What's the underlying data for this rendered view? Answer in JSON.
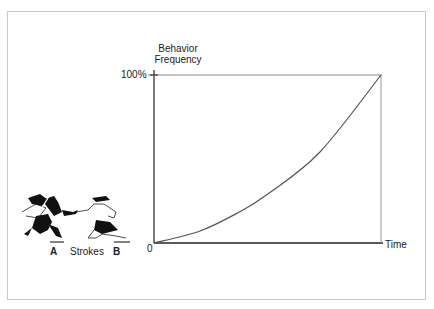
{
  "chart_data": {
    "type": "line",
    "title": "",
    "xlabel": "Time",
    "ylabel": "Behavior Frequency",
    "ylabel_lines": [
      "Behavior",
      "Frequency"
    ],
    "y_ticks": [
      "0",
      "100%"
    ],
    "x_ticks": [
      "0"
    ],
    "ylim": [
      0,
      100
    ],
    "xlim": [
      0,
      1
    ],
    "grid": false,
    "legend": null,
    "series": [
      {
        "name": "Behavior Frequency",
        "x": [
          0,
          0.2,
          0.37,
          0.5,
          0.73,
          1.0
        ],
        "values": [
          0,
          7,
          18,
          29,
          54,
          100
        ]
      }
    ],
    "annotations": [
      "Top-right box corner at (Time end, 100%)"
    ]
  },
  "illustration": {
    "label_a": "A",
    "label_middle": "Strokes",
    "label_b": "B",
    "description": "Two stylized figures, A reaching to stroke B"
  },
  "labels": {
    "ylabel_line1": "Behavior",
    "ylabel_line2": "Frequency",
    "tick_top": "100%",
    "tick_origin": "0",
    "xlabel": "Time"
  }
}
